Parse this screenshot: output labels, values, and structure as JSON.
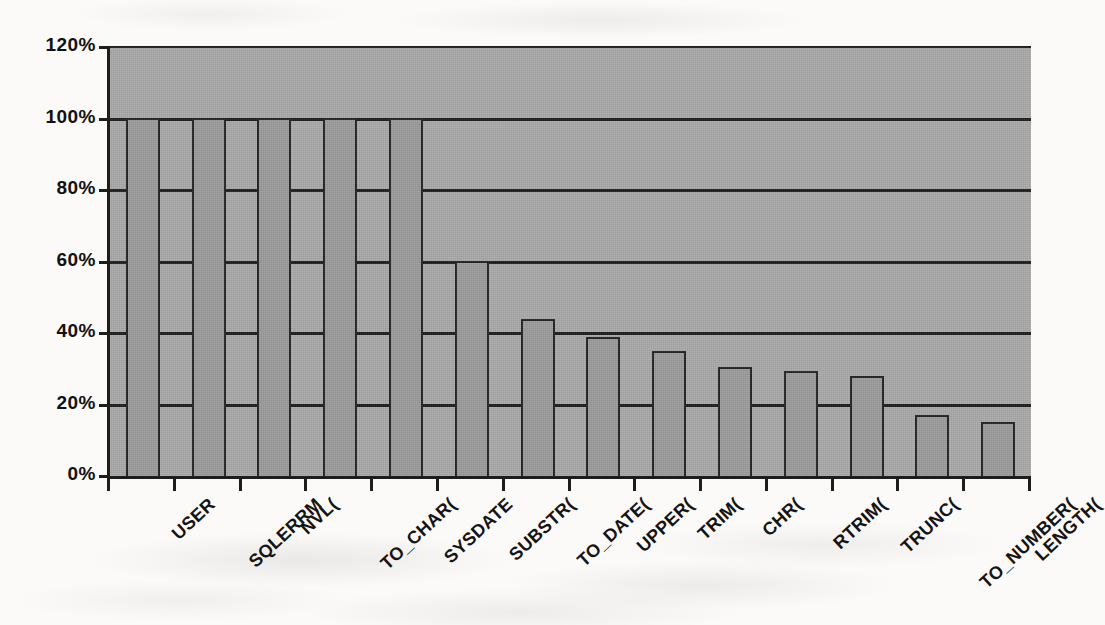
{
  "chart_data": {
    "type": "bar",
    "title": "",
    "subtitle": "",
    "xlabel": "",
    "ylabel": "",
    "categories": [
      "USER",
      "SQLERRM",
      "NVL(",
      "TO_CHAR(",
      "SYSDATE",
      "SUBSTR(",
      "TO_DATE(",
      "UPPER(",
      "TRIM(",
      "CHR(",
      "RTRIM(",
      "TRUNC(",
      "TO_NUMBER(",
      "LENGTH("
    ],
    "values": [
      100,
      100,
      100,
      100,
      100,
      60,
      44,
      39,
      35,
      30.5,
      29.5,
      28,
      17,
      15
    ],
    "value_labels": [
      "100%",
      "100%",
      "100%",
      "100%",
      "100%",
      "60%",
      "44%",
      "39%",
      "35%",
      "30%",
      "29%",
      "28%",
      "17%",
      "15%"
    ],
    "ylim": [
      0,
      120
    ],
    "ytick_values": [
      0,
      20,
      40,
      60,
      80,
      100,
      120
    ],
    "ytick_labels": [
      "0%",
      "20%",
      "40%",
      "60%",
      "80%",
      "100%",
      "120%"
    ],
    "grid": true,
    "grid_axis": "y",
    "legend": null,
    "legend_position": "none",
    "series_name": "",
    "colors": {
      "bar_fill": "#9b9b9b",
      "bar_border": "#222222",
      "plot_background": "#a9a9a9",
      "gridline": "#1d1d1d",
      "axis": "#1d1d1d",
      "text": "#111111",
      "page_background": "#fbfaf8"
    }
  }
}
